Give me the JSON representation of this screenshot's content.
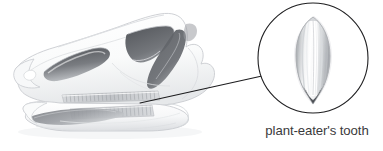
{
  "figure": {
    "type": "scientific-illustration",
    "background_color": "#ffffff",
    "render_style": "grayscale pencil / airbrush shading",
    "skull": {
      "name": "plant-eater skull",
      "outline_color": "#c9cbce",
      "fill_color": "#fbfbfc",
      "shadow_color": "#d8dadd",
      "parts": [
        {
          "name": "narial-opening",
          "label": "external naris",
          "fill": "#5d6065"
        },
        {
          "name": "orbit",
          "label": "eye socket",
          "fill": "#63666b"
        },
        {
          "name": "infratemporal-bar",
          "label": "jugal / quadrate bar",
          "fill": "#5a5d62"
        },
        {
          "name": "upper-tooth-row",
          "label": "maxillary dental battery",
          "fill": "#b9bcc0"
        },
        {
          "name": "lower-tooth-row",
          "label": "dentary dental battery",
          "fill": "#c2c5c9"
        },
        {
          "name": "lower-jaw-shadow",
          "label": "dentary shadow",
          "fill": "#8b8f94"
        },
        {
          "name": "beak",
          "label": "predentary beak",
          "fill": "#f4f5f6"
        }
      ]
    },
    "callout": {
      "label": "plant-eater's tooth",
      "label_color": "#3a3a3c",
      "circle": {
        "cx": 313,
        "cy": 58,
        "r": 55,
        "stroke": "#1f1f21",
        "stroke_width": 1.1,
        "fill": "#ffffff"
      },
      "leader_line": {
        "x1": 140,
        "y1": 103,
        "x2": 262,
        "y2": 76,
        "stroke": "#1c1c1e",
        "stroke_width": 1.1
      },
      "tooth": {
        "name": "leaf-shaped tooth",
        "shape": "spade / leaf with vertical ridges and denticulate margins",
        "highlight": "#ffffff",
        "midtone": "#c6c8cb",
        "shadow": "#7d8085",
        "root_tip": "#4e5156"
      }
    }
  }
}
